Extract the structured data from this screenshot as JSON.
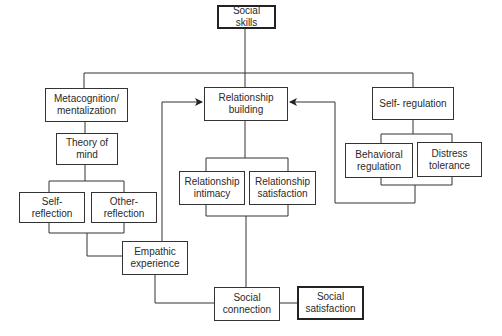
{
  "diagram": {
    "nodes": {
      "social_skills": "Social skills",
      "metacognition": "Metacognition/ mentalization",
      "relationship_building": "Relationship building",
      "self_regulation": "Self- regulation",
      "theory_of_mind": "Theory of mind",
      "self_reflection": "Self- reflection",
      "other_reflection": "Other- reflection",
      "relationship_intimacy": "Relationship intimacy",
      "relationship_satisfaction": "Relationship satisfaction",
      "behavioral_regulation": "Behavioral regulation",
      "distress_tolerance": "Distress tolerance",
      "empathic_experience": "Empathic experience",
      "social_connection": "Social connection",
      "social_satisfaction": "Social satisfaction"
    },
    "edges": [
      {
        "from": "social_skills",
        "to": "metacognition"
      },
      {
        "from": "social_skills",
        "to": "relationship_building"
      },
      {
        "from": "social_skills",
        "to": "self_regulation"
      },
      {
        "from": "metacognition",
        "to": "theory_of_mind"
      },
      {
        "from": "theory_of_mind",
        "to": [
          "self_reflection",
          "other_reflection"
        ]
      },
      {
        "from": [
          "self_reflection",
          "other_reflection"
        ],
        "to": "empathic_experience"
      },
      {
        "from": "empathic_experience",
        "to": "relationship_building",
        "arrow": true
      },
      {
        "from": "empathic_experience",
        "to": "social_connection"
      },
      {
        "from": "relationship_building",
        "to": [
          "relationship_intimacy",
          "relationship_satisfaction"
        ]
      },
      {
        "from": [
          "relationship_intimacy",
          "relationship_satisfaction"
        ],
        "to": "social_connection"
      },
      {
        "from": "self_regulation",
        "to": [
          "behavioral_regulation",
          "distress_tolerance"
        ]
      },
      {
        "from": [
          "behavioral_regulation",
          "distress_tolerance"
        ],
        "to": "relationship_building",
        "arrow": true
      },
      {
        "from": "social_connection",
        "to": "social_satisfaction"
      }
    ],
    "colors": {
      "line": "#333333",
      "box_border": "#333333",
      "text": "#2a2a2a"
    }
  }
}
